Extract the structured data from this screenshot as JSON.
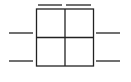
{
  "diagram": {
    "type": "2x2 grid block with connector leads",
    "stroke_color": "#222222",
    "background": "#ffffff",
    "grid": {
      "x": 36.5,
      "y": 9,
      "width": 57,
      "height": 57,
      "rows": 2,
      "cols": 2
    },
    "leads": {
      "top": [
        {
          "x1": 38,
          "x2": 62,
          "y": 5
        },
        {
          "x1": 66,
          "x2": 91,
          "y": 5
        }
      ],
      "left": [
        {
          "x1": 9,
          "x2": 33,
          "y": 33
        },
        {
          "x1": 9,
          "x2": 33,
          "y": 61
        }
      ],
      "right": [
        {
          "x1": 96,
          "x2": 120,
          "y": 33
        },
        {
          "x1": 96,
          "x2": 120,
          "y": 61
        }
      ]
    }
  }
}
